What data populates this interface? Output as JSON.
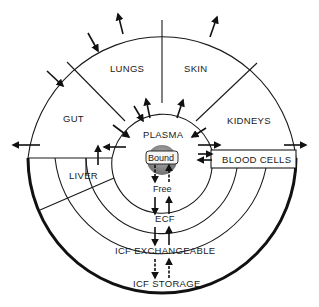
{
  "diagram": {
    "type": "compartment-model",
    "regions": {
      "lungs": "LUNGS",
      "skin": "SKIN",
      "gut": "GUT",
      "kidneys": "KIDNEYS",
      "liver": "LIVER",
      "plasma": "PLASMA",
      "bound": "Bound",
      "free": "Free",
      "blood_cells": "BLOOD CELLS",
      "ecf": "ECF",
      "icf_exchangeable": "ICF EXCHANGEABLE",
      "icf_storage": "ICF STORAGE"
    },
    "colors": {
      "ink": "#1a1a1a",
      "bound_fill": "#8a8a8a",
      "background": "#ffffff"
    }
  }
}
